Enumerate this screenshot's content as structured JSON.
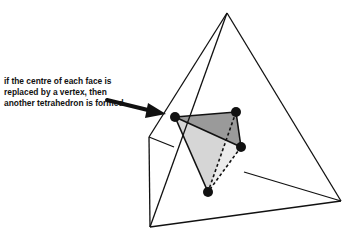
{
  "diagram": {
    "caption": "if the centre of each face is replaced by a vertex, then another tetrahedron is formed",
    "colors": {
      "line": "#111111",
      "dark_face": "#9a9a9a",
      "light_face": "#d6d6d6",
      "lighter_face": "#ececec",
      "background": "#ffffff"
    },
    "outer_tetrahedron": {
      "vertices": {
        "apex": [
          227,
          13
        ],
        "left": [
          149,
          137
        ],
        "bottom": [
          150,
          227
        ],
        "right": [
          341,
          201
        ]
      }
    },
    "inner_tetrahedron": {
      "vertices": {
        "a": [
          175,
          117
        ],
        "b": [
          236,
          112
        ],
        "c": [
          241,
          147
        ],
        "d": [
          208,
          192
        ]
      }
    }
  }
}
